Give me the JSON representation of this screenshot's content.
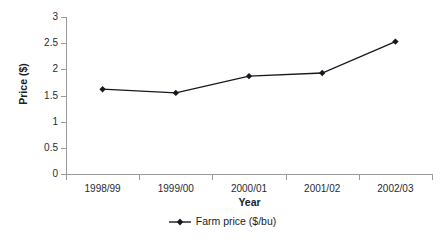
{
  "chart_data": {
    "type": "line",
    "title": "",
    "xlabel": "Year",
    "ylabel": "Price ($)",
    "categories": [
      "1998/99",
      "1999/00",
      "2000/01",
      "2001/02",
      "2002/03"
    ],
    "series": [
      {
        "name": "Farm price ($/bu)",
        "values": [
          1.62,
          1.55,
          1.87,
          1.93,
          2.53
        ],
        "color": "#17171f",
        "marker": "diamond"
      }
    ],
    "ylim": [
      0,
      3
    ],
    "ytick_step": 0.5,
    "yticks": [
      "0",
      "0.5",
      "1",
      "1.5",
      "2",
      "2.5",
      "3"
    ],
    "grid": false,
    "legend_position": "bottom-center"
  },
  "axes": {
    "axis_color": "#9a9a9a",
    "tick_color": "#9a9a9a",
    "label_color": "#2a2a33"
  },
  "legend": {
    "entries": [
      {
        "label": "Farm price ($/bu)",
        "marker_icon": "line-diamond-marker-icon"
      }
    ]
  },
  "background": "#ffffff"
}
